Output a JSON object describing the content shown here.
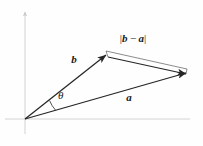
{
  "figure": {
    "background_color": "#fefefe",
    "axis_color": "#c9c9c9",
    "vector_color": "#262626",
    "labels": {
      "vector_b": "b",
      "vector_a": "a",
      "angle": "θ",
      "difference_open_bar": "|",
      "difference_b": "b",
      "difference_minus": "−",
      "difference_a": "a",
      "difference_close_bar": "|",
      "difference_full": "|b − a|"
    },
    "axes": {
      "origin_x": 25,
      "origin_y": 119,
      "x_axis_start_x": 5,
      "x_axis_end_x": 190,
      "y_axis_top_y": 10,
      "y_axis_bottom_y": 134
    },
    "vectors": [
      {
        "name": "b",
        "from_x": 25,
        "from_y": 119,
        "to_x": 106,
        "to_y": 55,
        "label_x": 74,
        "label_y": 63
      },
      {
        "name": "a",
        "from_x": 25,
        "from_y": 119,
        "to_x": 186,
        "to_y": 73,
        "label_x": 129,
        "label_y": 101
      },
      {
        "name": "b-a",
        "from_x": 108,
        "from_y": 57,
        "to_x": 186,
        "to_y": 74,
        "label_x": 133,
        "label_y": 41
      }
    ],
    "angle_arc": {
      "label_x": 57,
      "label_y": 97,
      "radius": 30
    },
    "measure_line": {
      "from_x": 106,
      "from_y": 51,
      "to_x": 187,
      "to_y": 69
    }
  }
}
